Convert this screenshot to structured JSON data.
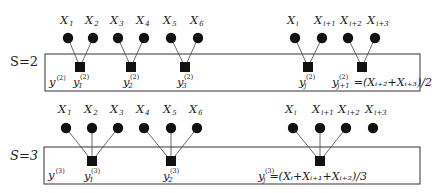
{
  "panels": [
    {
      "scale_label": "S=2",
      "scale_label_y": 66,
      "box": {
        "x": 45,
        "y": 54,
        "w": 375,
        "h": 37
      },
      "series_label": {
        "text": "y",
        "sup": "(2)",
        "x": 49,
        "y": 86
      },
      "inputs_y": 38,
      "label_y": 24,
      "inputs": [
        {
          "name": "X",
          "sub": "1",
          "x": 68
        },
        {
          "name": "X",
          "sub": "2",
          "x": 93
        },
        {
          "name": "X",
          "sub": "3",
          "x": 118
        },
        {
          "name": "X",
          "sub": "4",
          "x": 144
        },
        {
          "name": "X",
          "sub": "5",
          "x": 171
        },
        {
          "name": "X",
          "sub": "6",
          "x": 198
        },
        {
          "name": "X",
          "sub": "i",
          "x": 295
        },
        {
          "name": "X",
          "sub": "i+1",
          "x": 322
        },
        {
          "name": "X",
          "sub": "i+2",
          "x": 348
        },
        {
          "name": "X",
          "sub": "i+3",
          "x": 375
        }
      ],
      "aggregates": [
        {
          "x": 80,
          "y": 67,
          "from": [
            0,
            1
          ],
          "label": "y",
          "sub": "1",
          "sup": "(2)",
          "label_x": 73,
          "label_y": 86,
          "formula": ""
        },
        {
          "x": 131,
          "y": 67,
          "from": [
            2,
            3
          ],
          "label": "y",
          "sub": "2",
          "sup": "(2)",
          "label_x": 123,
          "label_y": 86,
          "formula": ""
        },
        {
          "x": 185,
          "y": 67,
          "from": [
            4,
            5
          ],
          "label": "y",
          "sub": "3",
          "sup": "(2)",
          "label_x": 177,
          "label_y": 86,
          "formula": ""
        },
        {
          "x": 308,
          "y": 67,
          "from": [
            6,
            7
          ],
          "label": "y",
          "sub": "j",
          "sup": "(2)",
          "label_x": 299,
          "label_y": 86,
          "formula": ""
        },
        {
          "x": 362,
          "y": 67,
          "from": [
            8,
            9
          ],
          "label": "y",
          "sub": "j+1",
          "sup": "(2)",
          "label_x": 332,
          "label_y": 86,
          "formula": "=(Xᵢ₊₂+Xᵢ₊₃)/2"
        }
      ]
    },
    {
      "scale_label": "S=3",
      "scale_label_y": 160,
      "box": {
        "x": 44,
        "y": 147,
        "w": 376,
        "h": 37
      },
      "series_label": {
        "text": "y",
        "sup": "(3)",
        "x": 48,
        "y": 179
      },
      "inputs_y": 128,
      "label_y": 113,
      "inputs": [
        {
          "name": "X",
          "sub": "1",
          "x": 66
        },
        {
          "name": "X",
          "sub": "2",
          "x": 92
        },
        {
          "name": "X",
          "sub": "3",
          "x": 118
        },
        {
          "name": "X",
          "sub": "4",
          "x": 144
        },
        {
          "name": "X",
          "sub": "5",
          "x": 171
        },
        {
          "name": "X",
          "sub": "6",
          "x": 197
        },
        {
          "name": "X",
          "sub": "i",
          "x": 293
        },
        {
          "name": "X",
          "sub": "i+1",
          "x": 320
        },
        {
          "name": "X",
          "sub": "i+2",
          "x": 346
        },
        {
          "name": "X",
          "sub": "i+3",
          "x": 373
        }
      ],
      "aggregates": [
        {
          "x": 92,
          "y": 161,
          "from": [
            0,
            1,
            2
          ],
          "label": "y",
          "sub": "1",
          "sup": "(3)",
          "label_x": 84,
          "label_y": 180,
          "formula": ""
        },
        {
          "x": 171,
          "y": 161,
          "from": [
            3,
            4,
            5
          ],
          "label": "y",
          "sub": "2",
          "sup": "(3)",
          "label_x": 163,
          "label_y": 180,
          "formula": ""
        },
        {
          "x": 320,
          "y": 161,
          "from": [
            6,
            7,
            8
          ],
          "label": "y",
          "sub": "j",
          "sup": "(3)",
          "label_x": 258,
          "label_y": 180,
          "formula": "=(Xᵢ+Xᵢ₊₁+Xᵢ₊₂)/3"
        }
      ]
    }
  ]
}
